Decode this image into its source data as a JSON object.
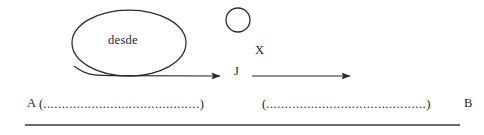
{
  "figure": {
    "background_color": "#ffffff",
    "stroke_color": "#2b2b2b",
    "text_color": "#1f1f1f"
  },
  "shapes": {
    "ellipse": {
      "label": "desde",
      "cx": 129,
      "cy": 43,
      "rx": 57,
      "ry": 33
    },
    "circle": {
      "cx": 238,
      "cy": 20,
      "r": 12
    }
  },
  "labels": {
    "ellipse_text": "desde",
    "x_label": "X",
    "j_label": "J",
    "a_label": "A",
    "b_label": "B"
  },
  "arrows": [
    {
      "name": "arrow-ellipse-to-j",
      "x1": 96,
      "y1": 74,
      "x2": 226,
      "y2": 76
    },
    {
      "name": "arrow-j-to-right",
      "x1": 252,
      "y1": 76,
      "x2": 356,
      "y2": 76
    }
  ],
  "dotted_spans": {
    "left": {
      "open_paren": "(",
      "dots": "..........................................",
      "close_paren": ")"
    },
    "right": {
      "open_paren": "(",
      "dots": "...........................................",
      "close_paren": ")"
    }
  },
  "rule": {
    "x1": 25,
    "x2": 460,
    "y": 125
  }
}
